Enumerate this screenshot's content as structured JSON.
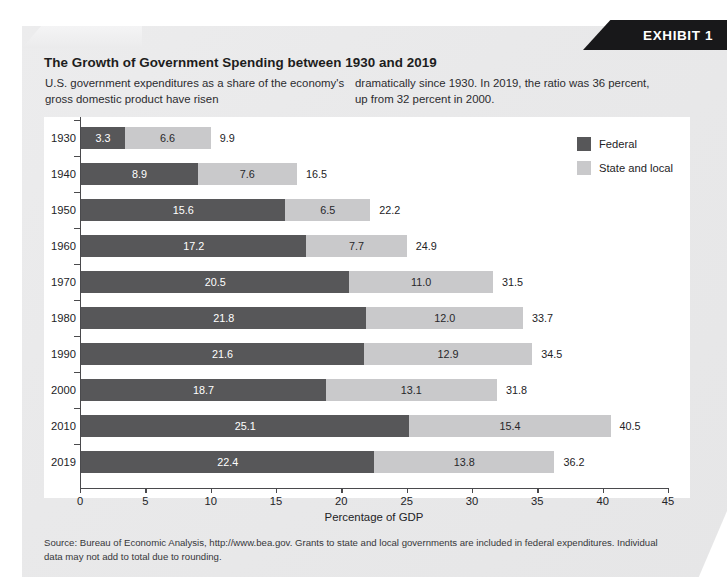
{
  "exhibit": {
    "badge_label": "EXHIBIT 1",
    "title": "The Growth of Government Spending between 1930 and 2019",
    "intro_left": "U.S. government expenditures as a share of the economy's gross domestic product have risen",
    "intro_right": "dramatically since 1930. In 2019, the ratio was 36 percent, up from 32 percent in 2000.",
    "source_note": "Source: Bureau of Economic Analysis, http://www.bea.gov. Grants to state and local governments are included in federal expenditures. Individual data may not add to total due to rounding."
  },
  "colors": {
    "federal": "#575759",
    "state_local": "#c9c9cb",
    "panel": "#ebebec",
    "badge": "#18181a",
    "axis": "#4a4a4d"
  },
  "legend": {
    "items": [
      {
        "label": "Federal",
        "color": "#575759"
      },
      {
        "label": "State and local",
        "color": "#c9c9cb"
      }
    ]
  },
  "chart_data": {
    "type": "bar",
    "orientation": "horizontal",
    "stacked": true,
    "title": "The Growth of Government Spending between 1930 and 2019",
    "xlabel": "Percentage of GDP",
    "ylabel": "",
    "xlim": [
      0,
      45
    ],
    "xticks": [
      0,
      5,
      10,
      15,
      20,
      25,
      30,
      35,
      40,
      45
    ],
    "grid": false,
    "legend_position": "top-right",
    "categories": [
      "1930",
      "1940",
      "1950",
      "1960",
      "1970",
      "1980",
      "1990",
      "2000",
      "2010",
      "2019"
    ],
    "series": [
      {
        "name": "Federal",
        "color": "#575759",
        "values": [
          3.3,
          8.9,
          15.6,
          17.2,
          20.5,
          21.8,
          21.6,
          18.7,
          25.1,
          22.4
        ]
      },
      {
        "name": "State and local",
        "color": "#c9c9cb",
        "values": [
          6.6,
          7.6,
          6.5,
          7.7,
          11.0,
          12.0,
          12.9,
          13.1,
          15.4,
          13.8
        ]
      }
    ],
    "totals": [
      9.9,
      16.5,
      22.2,
      24.9,
      31.5,
      33.7,
      34.5,
      31.8,
      40.5,
      36.2
    ],
    "rows": [
      {
        "year": "1930",
        "federal": "3.3",
        "state_local": "6.6",
        "total": "9.9"
      },
      {
        "year": "1940",
        "federal": "8.9",
        "state_local": "7.6",
        "total": "16.5"
      },
      {
        "year": "1950",
        "federal": "15.6",
        "state_local": "6.5",
        "total": "22.2"
      },
      {
        "year": "1960",
        "federal": "17.2",
        "state_local": "7.7",
        "total": "24.9"
      },
      {
        "year": "1970",
        "federal": "20.5",
        "state_local": "11.0",
        "total": "31.5"
      },
      {
        "year": "1980",
        "federal": "21.8",
        "state_local": "12.0",
        "total": "33.7"
      },
      {
        "year": "1990",
        "federal": "21.6",
        "state_local": "12.9",
        "total": "34.5"
      },
      {
        "year": "2000",
        "federal": "18.7",
        "state_local": "13.1",
        "total": "31.8"
      },
      {
        "year": "2010",
        "federal": "25.1",
        "state_local": "15.4",
        "total": "40.5"
      },
      {
        "year": "2019",
        "federal": "22.4",
        "state_local": "13.8",
        "total": "36.2"
      }
    ]
  }
}
